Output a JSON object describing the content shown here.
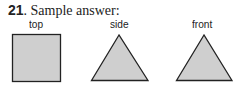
{
  "problem": {
    "number": "21",
    "title": "Sample answer:"
  },
  "views": [
    {
      "label": "top",
      "shape": "square"
    },
    {
      "label": "side",
      "shape": "triangle"
    },
    {
      "label": "front",
      "shape": "triangle"
    }
  ],
  "colors": {
    "fill": "#cfcfcf",
    "stroke": "#222222"
  }
}
